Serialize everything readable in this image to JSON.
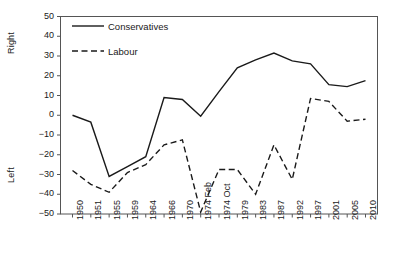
{
  "chart_data": {
    "type": "line",
    "title": "",
    "xlabel": "",
    "ylabel_top": "Right",
    "ylabel_bottom": "Left",
    "ylim": [
      -50,
      50
    ],
    "yticks": [
      50,
      40,
      30,
      20,
      10,
      0,
      -10,
      -20,
      -30,
      -40,
      -50
    ],
    "ytick_labels": [
      "50",
      "40",
      "30",
      "20",
      "10",
      "0",
      "−10",
      "−20",
      "−30",
      "−40",
      "−50"
    ],
    "grid": false,
    "legend_position": "top-left-inside",
    "categories": [
      "1950",
      "1951",
      "1955",
      "1959",
      "1964",
      "1966",
      "1970",
      "1974 Feb",
      "1974 Oct",
      "1979",
      "1983",
      "1987",
      "1992",
      "1997",
      "2001",
      "2005",
      "2010"
    ],
    "series": [
      {
        "name": "Conservatives",
        "style": "solid",
        "color": "#1a1a1a",
        "values": [
          0,
          -3.5,
          -31,
          -26,
          -21,
          9,
          8,
          -0.5,
          12,
          24,
          28,
          31.5,
          27.5,
          26,
          15.5,
          14.5,
          17.5
        ]
      },
      {
        "name": "Labour",
        "style": "dashed",
        "color": "#1a1a1a",
        "values": [
          -28,
          -35,
          -39,
          -29,
          -25,
          -15,
          -12.5,
          -49,
          -27.5,
          -27.5,
          -40,
          -15,
          -32.5,
          8.5,
          7,
          -3,
          -2
        ]
      }
    ]
  },
  "legend": {
    "items": [
      {
        "label": "Conservatives",
        "style": "solid"
      },
      {
        "label": "Labour",
        "style": "dashed"
      }
    ]
  }
}
